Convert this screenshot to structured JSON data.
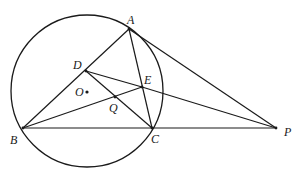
{
  "diagram": {
    "type": "geometry",
    "stroke_color": "#1a1a1a",
    "circle": {
      "name": "O",
      "cx": 87,
      "cy": 91,
      "r": 76
    },
    "points": [
      {
        "name": "A",
        "x": 129,
        "y": 29,
        "label_dx": -2,
        "label_dy": -15
      },
      {
        "name": "B",
        "x": 23,
        "y": 128,
        "label_dx": -13,
        "label_dy": 6
      },
      {
        "name": "C",
        "x": 152,
        "y": 128,
        "label_dx": -1,
        "label_dy": 5
      },
      {
        "name": "D",
        "x": 86,
        "y": 71,
        "label_dx": -13,
        "label_dy": -12
      },
      {
        "name": "E",
        "x": 142,
        "y": 87,
        "label_dx": 2,
        "label_dy": -13
      },
      {
        "name": "Q",
        "x": 115,
        "y": 97,
        "label_dx": -6,
        "label_dy": 5
      },
      {
        "name": "O",
        "x": 87,
        "y": 92,
        "label_dx": -12,
        "label_dy": -6
      },
      {
        "name": "P",
        "x": 276,
        "y": 128,
        "label_dx": 8,
        "label_dy": -2
      }
    ],
    "segments": [
      [
        "A",
        "B"
      ],
      [
        "A",
        "C"
      ],
      [
        "B",
        "C"
      ],
      [
        "C",
        "P"
      ],
      [
        "A",
        "P"
      ],
      [
        "E",
        "P"
      ],
      [
        "D",
        "E"
      ],
      [
        "D",
        "C"
      ],
      [
        "B",
        "E"
      ]
    ],
    "labels": {
      "A": "A",
      "B": "B",
      "C": "C",
      "D": "D",
      "E": "E",
      "Q": "Q",
      "O": "O",
      "P": "P"
    }
  }
}
